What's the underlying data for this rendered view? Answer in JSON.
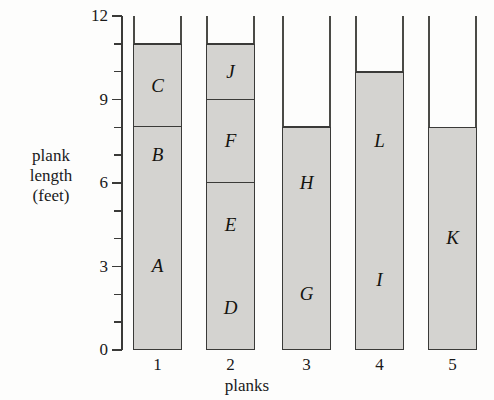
{
  "chart_data": {
    "type": "bar",
    "title": "",
    "subtitle": "",
    "xlabel": "planks",
    "ylabel": "plank length (feet)",
    "ylabel_lines": [
      "plank",
      "length",
      "(feet)"
    ],
    "categories": [
      "1",
      "2",
      "3",
      "4",
      "5"
    ],
    "ylim": [
      0,
      12
    ],
    "ytick_labels": [
      "0",
      "3",
      "6",
      "9",
      "12"
    ],
    "ytick_values": [
      0,
      3,
      6,
      9,
      12
    ],
    "yminor_values": [
      1,
      2,
      4,
      5,
      7,
      8,
      10,
      11
    ],
    "grid": false,
    "legend": "none",
    "stacked": true,
    "bar_fill_color": "#d4d3d0",
    "bar_edge_color": "#3a3a38",
    "column_capacity": 12,
    "series": [
      {
        "name": "1",
        "total": 11,
        "segments": [
          {
            "label": "A",
            "start": 0,
            "end": 6,
            "value": 6
          },
          {
            "label": "B",
            "start": 6,
            "end": 8,
            "value": 2
          },
          {
            "label": "C",
            "start": 8,
            "end": 11,
            "value": 3
          }
        ]
      },
      {
        "name": "2",
        "total": 11,
        "segments": [
          {
            "label": "D",
            "start": 0,
            "end": 3,
            "value": 3
          },
          {
            "label": "E",
            "start": 3,
            "end": 6,
            "value": 3
          },
          {
            "label": "F",
            "start": 6,
            "end": 9,
            "value": 3
          },
          {
            "label": "J",
            "start": 9,
            "end": 11,
            "value": 2
          }
        ]
      },
      {
        "name": "3",
        "total": 8,
        "segments": [
          {
            "label": "G",
            "start": 0,
            "end": 4,
            "value": 4
          },
          {
            "label": "H",
            "start": 4,
            "end": 8,
            "value": 4
          }
        ]
      },
      {
        "name": "4",
        "total": 10,
        "segments": [
          {
            "label": "I",
            "start": 0,
            "end": 5,
            "value": 5
          },
          {
            "label": "L",
            "start": 5,
            "end": 10,
            "value": 5
          }
        ]
      },
      {
        "name": "5",
        "total": 8,
        "segments": [
          {
            "label": "K",
            "start": 0,
            "end": 8,
            "value": 8
          }
        ]
      }
    ]
  }
}
